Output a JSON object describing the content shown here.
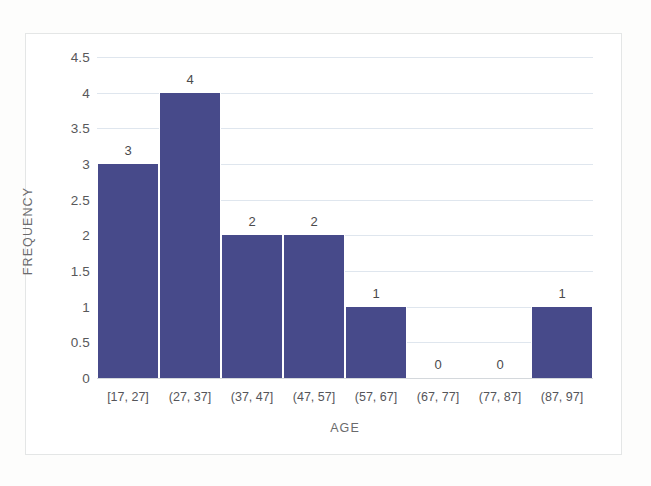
{
  "chart_data": {
    "type": "bar",
    "title": "",
    "xlabel": "AGE",
    "ylabel": "FREQUENCY",
    "categories": [
      "[17, 27]",
      "(27, 37]",
      "(37, 47]",
      "(47, 57]",
      "(57, 67]",
      "(67, 77]",
      "(77, 87]",
      "(87, 97]"
    ],
    "values": [
      3,
      4,
      2,
      2,
      1,
      0,
      0,
      1
    ],
    "value_labels": [
      "3",
      "4",
      "2",
      "2",
      "1",
      "0",
      "0",
      "1"
    ],
    "ylim": [
      0,
      4.5
    ],
    "ytick_labels": [
      "0",
      "0.5",
      "1",
      "1.5",
      "2",
      "2.5",
      "3",
      "3.5",
      "4",
      "4.5"
    ],
    "ytick_values": [
      0,
      0.5,
      1,
      1.5,
      2,
      2.5,
      3,
      3.5,
      4,
      4.5
    ],
    "grid": true,
    "legend": false,
    "bar_color": "#474a8a",
    "gridline_color": "#dfe6ee",
    "frame_color": "#e4e6e6",
    "text_color": "#55555a"
  }
}
